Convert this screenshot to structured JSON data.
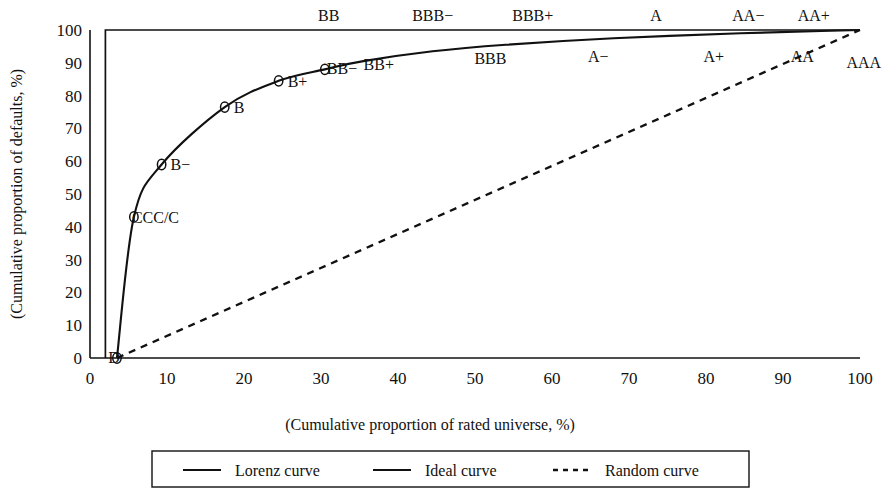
{
  "chart_data": {
    "type": "line",
    "title": "",
    "xlabel": "(Cumulative proportion of rated universe, %)",
    "ylabel": "(Cumulative proportion of defaults, %)",
    "xlim": [
      0,
      100
    ],
    "ylim": [
      0,
      100
    ],
    "xticks": [
      "0",
      "10",
      "20",
      "30",
      "40",
      "50",
      "60",
      "70",
      "80",
      "90",
      "100"
    ],
    "yticks": [
      "0",
      "10",
      "20",
      "30",
      "40",
      "50",
      "60",
      "70",
      "80",
      "90",
      "100"
    ],
    "grid": false,
    "legend_position": "bottom",
    "series": [
      {
        "name": "Lorenz curve",
        "style": "solid",
        "x": [
          3.5,
          5.7,
          9.3,
          17.5,
          24.5,
          30.5,
          35.5,
          44.5,
          54.0,
          68.0,
          84.5,
          95.0,
          100.0
        ],
        "y": [
          0.0,
          43.0,
          59.0,
          76.5,
          84.5,
          88.0,
          90.5,
          93.5,
          95.5,
          97.5,
          99.0,
          99.7,
          100.0
        ],
        "point_labels": [
          "D",
          "CCC/C",
          "B−",
          "B",
          "B+",
          "BB−",
          "BB+",
          "BBB",
          "A−",
          "A+",
          "AA",
          "AAA",
          "AAA"
        ]
      },
      {
        "name": "Ideal curve",
        "style": "solid",
        "x": [
          2.0,
          2.0,
          100.0
        ],
        "y": [
          0.0,
          100.0,
          100.0
        ]
      },
      {
        "name": "Random curve",
        "style": "dashed",
        "x": [
          3.5,
          100.0
        ],
        "y": [
          0.0,
          100.0
        ]
      }
    ],
    "annotations_above": [
      {
        "label": "BB",
        "x": 31.0,
        "y": 100.0
      },
      {
        "label": "BBB−",
        "x": 44.5,
        "y": 100.0
      },
      {
        "label": "BBB+",
        "x": 57.5,
        "y": 100.0
      },
      {
        "label": "A",
        "x": 73.5,
        "y": 100.0
      },
      {
        "label": "AA−",
        "x": 85.5,
        "y": 100.0
      },
      {
        "label": "AA+",
        "x": 94.0,
        "y": 100.0
      }
    ],
    "annotations_on_curve": [
      {
        "label": "CCC/C",
        "x": 5.7,
        "y": 43.0
      },
      {
        "label": "B−",
        "x": 9.3,
        "y": 59.0
      },
      {
        "label": "B",
        "x": 17.5,
        "y": 76.5
      },
      {
        "label": "B+",
        "x": 24.5,
        "y": 84.5
      },
      {
        "label": "BB−",
        "x": 30.5,
        "y": 88.0
      },
      {
        "label": "BB+",
        "x": 37.5,
        "y": 89.5
      },
      {
        "label": "BBB",
        "x": 52.0,
        "y": 91.5
      },
      {
        "label": "A−",
        "x": 66.0,
        "y": 92.0
      },
      {
        "label": "A+",
        "x": 81.0,
        "y": 92.0
      },
      {
        "label": "AA",
        "x": 92.5,
        "y": 92.0
      },
      {
        "label": "AAA",
        "x": 100.5,
        "y": 91.0
      },
      {
        "label": "D",
        "x": 3.5,
        "y": 0.0
      }
    ]
  },
  "axis": {
    "x_title": "(Cumulative proportion of rated universe, %)",
    "y_title": "(Cumulative proportion of defaults, %)"
  },
  "legend": {
    "items": [
      {
        "label": "Lorenz curve",
        "style": "solid"
      },
      {
        "label": "Ideal curve",
        "style": "solid"
      },
      {
        "label": "Random curve",
        "style": "dashed"
      }
    ]
  },
  "colors": {
    "ink": "#111111",
    "background": "#ffffff"
  }
}
